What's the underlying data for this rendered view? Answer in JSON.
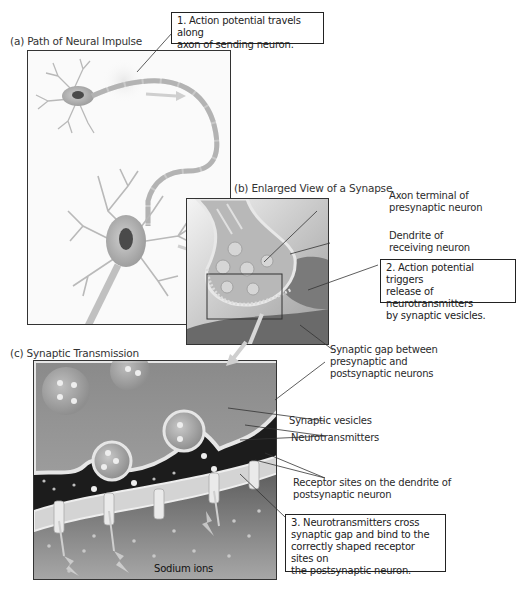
{
  "figure": {
    "panels": [
      {
        "id": "a",
        "title": "(a) Path of Neural Impulse"
      },
      {
        "id": "b",
        "title": "(b) Enlarged View of a Synapse"
      },
      {
        "id": "c",
        "title": "(c) Synaptic Transmission"
      }
    ],
    "callouts": [
      {
        "step": "1",
        "lines": [
          "1. Action potential travels along",
          "axon of sending neuron."
        ]
      },
      {
        "step": "2",
        "lines": [
          "2. Action potential triggers",
          "release of neurotransmitters",
          "by synaptic vesicles."
        ]
      },
      {
        "step": "3",
        "lines": [
          "3. Neurotransmitters cross",
          "synaptic gap and bind to the",
          "correctly shaped receptor sites on",
          "the postsynaptic neuron."
        ]
      }
    ],
    "labels": {
      "axon_terminal": [
        "Axon terminal of",
        "presynaptic neuron"
      ],
      "dendrite": [
        "Dendrite of",
        "receiving neuron"
      ],
      "synaptic_gap": [
        "Synaptic gap between",
        "presynaptic and",
        "postsynaptic neurons"
      ],
      "synaptic_vesicles": "Synaptic vesicles",
      "neurotransmitters": "Neurotransmitters",
      "receptor_sites": [
        "Receptor sites on the dendrite of",
        "postsynaptic neuron"
      ],
      "sodium_ions": "Sodium ions"
    },
    "colors": {
      "panel_border": "#333333",
      "neuron_fill": "#d8d8d8",
      "background_dark": "#1e1e1e",
      "cell_gray": "#8a8a8a"
    }
  }
}
